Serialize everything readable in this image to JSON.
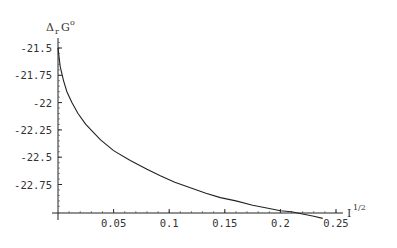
{
  "chart_data": {
    "type": "line",
    "title": "",
    "xlabel": "I^1/2",
    "xlabel_base": "I",
    "xlabel_sup": "1/2",
    "ylabel": "ΔrG°",
    "ylabel_delta": "Δ",
    "ylabel_sub": "r",
    "ylabel_main": "G",
    "ylabel_sup": "o",
    "xlim": [
      0,
      0.26
    ],
    "ylim": [
      -23.0,
      -21.45
    ],
    "x_ticks": [
      0.05,
      0.1,
      0.15,
      0.2,
      0.25
    ],
    "x_tick_labels": [
      "0.05",
      "0.1",
      "0.15",
      "0.2",
      "0.25"
    ],
    "y_ticks": [
      -21.5,
      -21.75,
      -22,
      -22.25,
      -22.5,
      -22.75
    ],
    "y_tick_labels": [
      "-21.5",
      "-21.75",
      "-22",
      "-22.25",
      "-22.5",
      "-22.75"
    ],
    "grid": false,
    "legend": null,
    "series": [
      {
        "name": "ΔrG° vs I^1/2",
        "x": [
          0.0,
          0.002,
          0.005,
          0.008,
          0.0125,
          0.018,
          0.025,
          0.038,
          0.05,
          0.065,
          0.08,
          0.092,
          0.105,
          0.119,
          0.133,
          0.146,
          0.16,
          0.175,
          0.19,
          0.2,
          0.21,
          0.22,
          0.23,
          0.238
        ],
        "values": [
          -21.5,
          -21.67,
          -21.8,
          -21.9,
          -22.0,
          -22.1,
          -22.2,
          -22.34,
          -22.44,
          -22.53,
          -22.61,
          -22.67,
          -22.73,
          -22.78,
          -22.83,
          -22.87,
          -22.9,
          -22.94,
          -22.97,
          -22.99,
          -23.0,
          -23.02,
          -23.04,
          -23.06
        ]
      }
    ]
  }
}
